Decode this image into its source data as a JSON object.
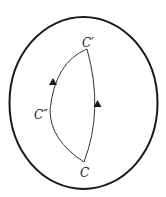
{
  "diagram": {
    "region": {
      "name": "outer-boundary",
      "shape": "ellipse"
    },
    "points": {
      "start": {
        "label": "C"
      },
      "end": {
        "label": "C′"
      },
      "via": {
        "label": "C″"
      }
    },
    "paths": [
      {
        "name": "right-path",
        "from": "C",
        "to": "C′",
        "arrow_direction": "up"
      },
      {
        "name": "left-path",
        "from": "C",
        "to": "C′",
        "through": "C″",
        "arrow_direction": "up"
      }
    ],
    "colors": {
      "stroke": "#1a1a1a",
      "background": "#ffffff"
    }
  }
}
